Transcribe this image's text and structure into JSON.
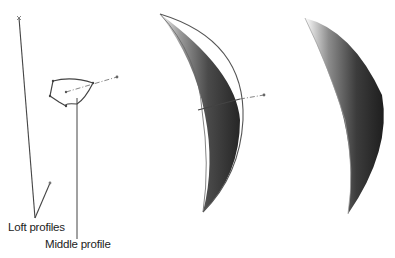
{
  "figure": {
    "panels": [
      {
        "id": "profiles",
        "description": "Loft profiles and middle profile sketch"
      },
      {
        "id": "preview",
        "description": "Loft preview with middle profile"
      },
      {
        "id": "result",
        "description": "Resulting lofted solid"
      }
    ],
    "callouts": {
      "loft_profiles": "Loft profiles",
      "middle_profile": "Middle profile"
    },
    "colors": {
      "line": "#555555",
      "surface_dark": "#2e2e2e",
      "surface_light": "#bdbdbd"
    }
  }
}
